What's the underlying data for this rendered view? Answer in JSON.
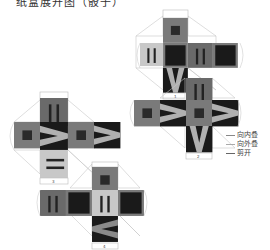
{
  "title": "纸盒展开图（骰子）",
  "nets": [
    {
      "id": 1,
      "label": "1"
    },
    {
      "id": 2,
      "label": "2"
    },
    {
      "id": 3,
      "label": "3"
    },
    {
      "id": 4,
      "label": "4"
    }
  ],
  "legend": {
    "items": [
      {
        "label": "向内叠",
        "meaning": "fold inward"
      },
      {
        "label": "向外叠",
        "meaning": "fold outward"
      },
      {
        "label": "剪开",
        "meaning": "cut"
      }
    ]
  },
  "colors": {
    "dark": "#1a1a1a",
    "mid": "#7a7a7a",
    "mid_dark": "#5a5a5a",
    "light": "#c8c8c8",
    "outline": "#c0c0c0"
  }
}
